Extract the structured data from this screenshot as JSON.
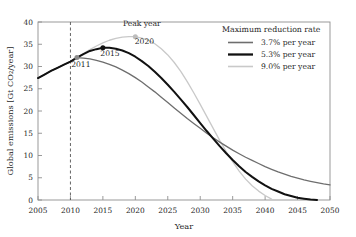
{
  "chart_data": {
    "type": "line",
    "title": "",
    "xlabel": "Year",
    "ylabel": "Global emissions [Gt CO2/year]",
    "xlim": [
      2005,
      2050
    ],
    "ylim": [
      0,
      40
    ],
    "xticks": [
      2005,
      2010,
      2015,
      2020,
      2025,
      2030,
      2035,
      2040,
      2045,
      2050
    ],
    "yticks": [
      0,
      5,
      10,
      15,
      20,
      25,
      30,
      35,
      40
    ],
    "grid": false,
    "legend_position": "top-right",
    "legend_title": "Maximum reduction rate",
    "reference_line_x": 2010,
    "reference_line_style": "dashed",
    "annotations": [
      {
        "text": "Peak year",
        "x": 2021.0,
        "y": 39.0
      },
      {
        "text": "2011",
        "x": 2011.6,
        "y": 29.8
      },
      {
        "text": "2015",
        "x": 2016.1,
        "y": 32.4
      },
      {
        "text": "2020",
        "x": 2021.4,
        "y": 35.0
      }
    ],
    "series": [
      {
        "name": "3.7% per year",
        "color": "#6e6e6e",
        "width": 1.3,
        "peak_year": 2011,
        "peak_value": 32.0,
        "marker": {
          "x": 2011,
          "y": 32.0,
          "color": "#8a8a8a"
        },
        "x": [
          2005,
          2006,
          2007,
          2008,
          2009,
          2010,
          2011,
          2012,
          2013,
          2014,
          2015,
          2016,
          2017,
          2018,
          2019,
          2020,
          2021,
          2022,
          2023,
          2024,
          2025,
          2026,
          2027,
          2028,
          2029,
          2030,
          2031,
          2032,
          2033,
          2034,
          2035,
          2036,
          2037,
          2038,
          2039,
          2040,
          2041,
          2042,
          2043,
          2044,
          2045,
          2046,
          2047,
          2048,
          2049,
          2050
        ],
        "y": [
          27.4,
          28.2,
          29.0,
          29.7,
          30.4,
          31.1,
          32.0,
          31.9,
          31.7,
          31.4,
          31.0,
          30.5,
          29.9,
          29.2,
          28.4,
          27.5,
          26.5,
          25.4,
          24.3,
          23.1,
          21.9,
          20.7,
          19.5,
          18.3,
          17.2,
          16.1,
          15.0,
          14.0,
          13.0,
          12.1,
          11.2,
          10.4,
          9.6,
          8.9,
          8.2,
          7.5,
          6.9,
          6.3,
          5.8,
          5.3,
          4.9,
          4.5,
          4.2,
          3.9,
          3.6,
          3.4
        ]
      },
      {
        "name": "5.3% per year",
        "color": "#111111",
        "width": 2.0,
        "peak_year": 2015,
        "peak_value": 34.2,
        "marker": {
          "x": 2015,
          "y": 34.2,
          "color": "#111111"
        },
        "x": [
          2005,
          2006,
          2007,
          2008,
          2009,
          2010,
          2011,
          2012,
          2013,
          2014,
          2015,
          2016,
          2017,
          2018,
          2019,
          2020,
          2021,
          2022,
          2023,
          2024,
          2025,
          2026,
          2027,
          2028,
          2029,
          2030,
          2031,
          2032,
          2033,
          2034,
          2035,
          2036,
          2037,
          2038,
          2039,
          2040,
          2041,
          2042,
          2043,
          2044,
          2045,
          2046,
          2047,
          2048
        ],
        "y": [
          27.4,
          28.2,
          29.0,
          29.7,
          30.4,
          31.1,
          32.0,
          32.8,
          33.5,
          33.9,
          34.2,
          34.2,
          34.0,
          33.6,
          33.0,
          32.2,
          31.2,
          30.1,
          28.8,
          27.4,
          25.9,
          24.3,
          22.6,
          20.9,
          19.1,
          17.3,
          15.5,
          13.8,
          12.1,
          10.5,
          9.0,
          7.6,
          6.3,
          5.2,
          4.2,
          3.3,
          2.5,
          1.9,
          1.3,
          0.9,
          0.5,
          0.3,
          0.1,
          0.0
        ]
      },
      {
        "name": "9.0% per year",
        "color": "#c9c9c9",
        "width": 1.3,
        "peak_year": 2020,
        "peak_value": 36.7,
        "marker": {
          "x": 2020,
          "y": 36.7,
          "color": "#bdbdbd"
        },
        "x": [
          2005,
          2006,
          2007,
          2008,
          2009,
          2010,
          2011,
          2012,
          2013,
          2014,
          2015,
          2016,
          2017,
          2018,
          2019,
          2020,
          2021,
          2022,
          2023,
          2024,
          2025,
          2026,
          2027,
          2028,
          2029,
          2030,
          2031,
          2032,
          2033,
          2034,
          2035,
          2036,
          2037,
          2038,
          2039,
          2040,
          2041
        ],
        "y": [
          27.4,
          28.2,
          29.0,
          29.7,
          30.4,
          31.1,
          32.0,
          32.9,
          33.8,
          34.6,
          35.3,
          35.9,
          36.3,
          36.6,
          36.7,
          36.7,
          36.4,
          35.9,
          35.1,
          34.0,
          32.6,
          30.9,
          28.9,
          26.6,
          24.1,
          21.5,
          18.8,
          16.1,
          13.4,
          10.9,
          8.6,
          6.5,
          4.7,
          3.2,
          2.0,
          1.0,
          0.2
        ]
      }
    ]
  }
}
